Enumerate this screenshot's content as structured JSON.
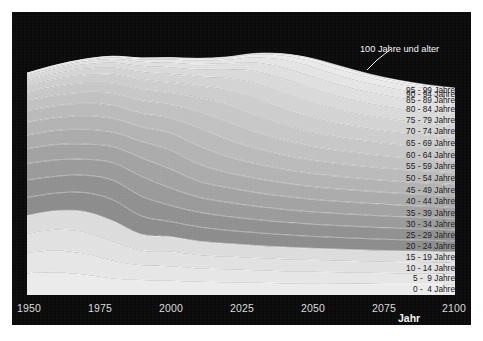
{
  "figure": {
    "background": "#ffffff",
    "canvas_color": "#0a0a0a"
  },
  "axis": {
    "title": "Jahr",
    "ticks": [
      "1950",
      "1975",
      "2000",
      "2025",
      "2050",
      "2075",
      "2100"
    ]
  },
  "callout": {
    "label": "100 Jahre und alter"
  },
  "chart_data": {
    "type": "area",
    "title": "",
    "subtitle": "",
    "xlabel": "Jahr",
    "ylabel": "",
    "xlim": [
      1950,
      2100
    ],
    "ylim": [
      0,
      100
    ],
    "grid": false,
    "legend_position": "inline-right",
    "stacked": true,
    "x": [
      1950,
      1960,
      1970,
      1980,
      1990,
      2000,
      2010,
      2020,
      2030,
      2040,
      2050,
      2060,
      2070,
      2080,
      2090,
      2100
    ],
    "series": [
      {
        "name": "0 -  4 Jahre",
        "color": "#ebebeb",
        "values": [
          9.2,
          9.6,
          8.6,
          7.0,
          6.3,
          6.0,
          5.6,
          5.4,
          5.2,
          5.0,
          4.9,
          4.8,
          4.7,
          4.6,
          4.6,
          4.5
        ]
      },
      {
        "name": "5 -  9 Jahre",
        "color": "#e6e6e6",
        "values": [
          8.6,
          9.2,
          8.9,
          7.4,
          6.2,
          6.1,
          5.6,
          5.4,
          5.2,
          5.0,
          4.9,
          4.8,
          4.7,
          4.6,
          4.6,
          4.5
        ]
      },
      {
        "name": "10 - 14 Jahre",
        "color": "#e1e1e1",
        "values": [
          8.0,
          8.7,
          9.0,
          8.1,
          6.3,
          6.2,
          5.7,
          5.4,
          5.2,
          5.1,
          4.9,
          4.8,
          4.7,
          4.7,
          4.6,
          4.5
        ]
      },
      {
        "name": "15 - 19 Jahre",
        "color": "#dcdcdc",
        "values": [
          7.7,
          8.0,
          8.7,
          8.8,
          6.8,
          6.3,
          5.8,
          5.5,
          5.3,
          5.1,
          5.0,
          4.9,
          4.8,
          4.7,
          4.6,
          4.6
        ]
      },
      {
        "name": "20 - 24 Jahre",
        "color": "#8c8c8c",
        "values": [
          7.6,
          7.4,
          8.0,
          8.9,
          7.7,
          6.4,
          6.0,
          5.6,
          5.4,
          5.2,
          5.0,
          4.9,
          4.8,
          4.7,
          4.7,
          4.6
        ]
      },
      {
        "name": "25 - 29 Jahre",
        "color": "#909090",
        "values": [
          7.4,
          7.1,
          7.3,
          8.2,
          8.4,
          6.8,
          6.2,
          5.8,
          5.5,
          5.3,
          5.1,
          5.0,
          4.9,
          4.8,
          4.7,
          4.7
        ]
      },
      {
        "name": "30 - 34 Jahre",
        "color": "#9a9a9a",
        "values": [
          6.9,
          6.9,
          6.7,
          7.4,
          8.4,
          7.4,
          6.4,
          6.0,
          5.6,
          5.4,
          5.2,
          5.1,
          5.0,
          4.9,
          4.8,
          4.7
        ]
      },
      {
        "name": "35 - 39 Jahre",
        "color": "#a2a2a2",
        "values": [
          6.2,
          6.5,
          6.4,
          6.7,
          7.7,
          8.0,
          6.7,
          6.2,
          5.8,
          5.5,
          5.3,
          5.1,
          5.0,
          4.9,
          4.8,
          4.8
        ]
      },
      {
        "name": "40 - 44 Jahre",
        "color": "#ababab",
        "values": [
          5.8,
          5.9,
          6.2,
          6.1,
          6.9,
          7.9,
          7.2,
          6.4,
          6.0,
          5.6,
          5.4,
          5.2,
          5.1,
          5.0,
          4.9,
          4.8
        ]
      },
      {
        "name": "45 - 49 Jahre",
        "color": "#b3b3b3",
        "values": [
          5.4,
          5.4,
          5.8,
          5.8,
          6.2,
          7.2,
          7.7,
          6.7,
          6.2,
          5.8,
          5.5,
          5.3,
          5.1,
          5.0,
          4.9,
          4.9
        ]
      },
      {
        "name": "50 - 54 Jahre",
        "color": "#bababa",
        "values": [
          4.8,
          5.0,
          5.2,
          5.5,
          5.7,
          6.4,
          7.6,
          7.2,
          6.5,
          6.0,
          5.6,
          5.4,
          5.2,
          5.1,
          5.0,
          4.9
        ]
      },
      {
        "name": "55 - 59 Jahre",
        "color": "#c1c1c1",
        "values": [
          4.2,
          4.4,
          4.6,
          5.0,
          5.3,
          5.6,
          6.9,
          7.5,
          6.8,
          6.3,
          5.8,
          5.5,
          5.3,
          5.1,
          5.0,
          4.9
        ]
      },
      {
        "name": "60 - 64 Jahre",
        "color": "#c7c7c7",
        "values": [
          3.6,
          3.8,
          4.0,
          4.4,
          4.8,
          5.0,
          5.9,
          7.1,
          7.1,
          6.5,
          6.0,
          5.6,
          5.4,
          5.2,
          5.1,
          5.0
        ]
      },
      {
        "name": "65 - 69 Jahre",
        "color": "#cdcdcd",
        "values": [
          2.9,
          3.1,
          3.3,
          3.7,
          4.1,
          4.3,
          4.9,
          6.2,
          7.1,
          6.7,
          6.2,
          5.7,
          5.4,
          5.2,
          5.1,
          5.0
        ]
      },
      {
        "name": "70 - 74 Jahre",
        "color": "#d3d3d3",
        "values": [
          2.2,
          2.4,
          2.6,
          2.9,
          3.3,
          3.6,
          3.9,
          5.0,
          6.4,
          6.6,
          6.2,
          5.7,
          5.4,
          5.2,
          5.0,
          4.9
        ]
      },
      {
        "name": "75 - 79 Jahre",
        "color": "#d9d9d9",
        "values": [
          1.5,
          1.7,
          1.9,
          2.1,
          2.5,
          2.8,
          3.0,
          3.7,
          5.1,
          6.0,
          6.0,
          5.6,
          5.2,
          5.0,
          4.8,
          4.7
        ]
      },
      {
        "name": "80 - 84 Jahre",
        "color": "#dfdfdf",
        "values": [
          0.9,
          1.0,
          1.2,
          1.4,
          1.7,
          2.0,
          2.2,
          2.5,
          3.6,
          4.8,
          5.2,
          5.0,
          4.7,
          4.5,
          4.3,
          4.2
        ]
      },
      {
        "name": "85 - 89 Jahre",
        "color": "#e4e4e4",
        "values": [
          0.4,
          0.5,
          0.6,
          0.8,
          1.0,
          1.2,
          1.4,
          1.5,
          2.2,
          3.2,
          3.9,
          3.9,
          3.7,
          3.5,
          3.4,
          3.3
        ]
      },
      {
        "name": "90 - 94 Jahre",
        "color": "#e9e9e9",
        "values": [
          0.15,
          0.2,
          0.25,
          0.3,
          0.45,
          0.6,
          0.7,
          0.8,
          1.1,
          1.7,
          2.3,
          2.5,
          2.4,
          2.3,
          2.2,
          2.2
        ]
      },
      {
        "name": "95 - 99 Jahre",
        "color": "#eeeeee",
        "values": [
          0.04,
          0.05,
          0.07,
          0.09,
          0.13,
          0.2,
          0.25,
          0.3,
          0.4,
          0.65,
          1.0,
          1.2,
          1.2,
          1.1,
          1.1,
          1.1
        ]
      },
      {
        "name": "100 Jahre und alter",
        "color": "#f4f4f4",
        "values": [
          0.01,
          0.01,
          0.01,
          0.02,
          0.03,
          0.04,
          0.06,
          0.08,
          0.11,
          0.18,
          0.3,
          0.4,
          0.45,
          0.45,
          0.44,
          0.44
        ]
      }
    ],
    "labels_right": [
      "95 - 99 Jahre",
      "90 - 94 Jahre",
      "85 - 89 Jahre",
      "80 - 84 Jahre",
      "75 - 79 Jahre",
      "70 - 74 Jahre",
      "65 - 69 Jahre",
      "60 - 64 Jahre",
      "55 - 59 Jahre",
      "50 - 54 Jahre",
      "45 - 49 Jahre",
      "40 - 44 Jahre",
      "35 - 39 Jahre",
      "30 - 34 Jahre",
      "25 - 29 Jahre",
      "20 - 24 Jahre",
      "15 - 19 Jahre",
      "10 - 14 Jahre",
      "5 -  9 Jahre",
      "0 -  4 Jahre"
    ]
  }
}
